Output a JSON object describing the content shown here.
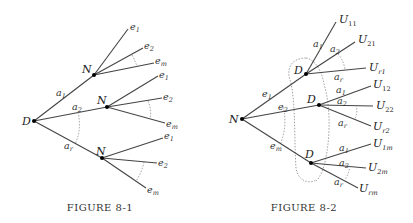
{
  "figures": [
    {
      "caption": "Figure 8-1",
      "caption_display": "FIGURE 8-1",
      "root": {
        "label": "D"
      },
      "branches": [
        {
          "edge_label": "a",
          "edge_sub": "1",
          "node": "N",
          "leaves": [
            {
              "l": "e",
              "s": "1"
            },
            {
              "l": "e",
              "s": "2"
            },
            {
              "l": "e",
              "s": "m"
            }
          ]
        },
        {
          "edge_label": "a",
          "edge_sub": "2",
          "node": "N",
          "leaves": [
            {
              "l": "e",
              "s": "1"
            },
            {
              "l": "e",
              "s": "2"
            },
            {
              "l": "e",
              "s": "m"
            }
          ]
        },
        {
          "edge_label": "a",
          "edge_sub": "r",
          "node": "N",
          "leaves": [
            {
              "l": "e",
              "s": "1"
            },
            {
              "l": "e",
              "s": "2"
            },
            {
              "l": "e",
              "s": "m"
            }
          ]
        }
      ]
    },
    {
      "caption": "Figure 8-2",
      "caption_display": "FIGURE 8-2",
      "root": {
        "label": "N"
      },
      "branches": [
        {
          "edge_label": "e",
          "edge_sub": "1",
          "node": "D",
          "leaves": [
            {
              "a": "a",
              "as": "1",
              "l": "U",
              "s": "11"
            },
            {
              "a": "a",
              "as": "2",
              "l": "U",
              "s": "21"
            },
            {
              "a": "a",
              "as": "r",
              "l": "U",
              "s": "r1"
            }
          ]
        },
        {
          "edge_label": "e",
          "edge_sub": "2",
          "node": "D",
          "leaves": [
            {
              "a": "a",
              "as": "1",
              "l": "U",
              "s": "12"
            },
            {
              "a": "a",
              "as": "2",
              "l": "U",
              "s": "22"
            },
            {
              "a": "a",
              "as": "r",
              "l": "U",
              "s": "r2"
            }
          ]
        },
        {
          "edge_label": "e",
          "edge_sub": "m",
          "node": "D",
          "leaves": [
            {
              "a": "a",
              "as": "1",
              "l": "U",
              "s": "1m"
            },
            {
              "a": "a",
              "as": "2",
              "l": "U",
              "s": "2m"
            },
            {
              "a": "a",
              "as": "r",
              "l": "U",
              "s": "rm"
            }
          ]
        }
      ]
    }
  ]
}
